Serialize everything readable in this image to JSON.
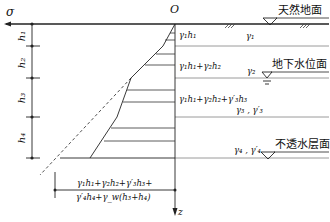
{
  "diagram": {
    "axes": {
      "sigma_label": "σ",
      "origin_label": "O",
      "z_label": "z"
    },
    "layers": [
      {
        "thickness_label": "h₁",
        "unit_weight": "γ₁",
        "stress_label": "γ₁h₁"
      },
      {
        "thickness_label": "h₂",
        "unit_weight": "γ₂",
        "stress_label": "γ₁h₁+γ₂h₂"
      },
      {
        "thickness_label": "h₃",
        "unit_weight": "γ₃ , γ′₃",
        "stress_label": "γ₁h₁+γ₂h₂+γ′₃h₃"
      },
      {
        "thickness_label": "h₄",
        "unit_weight": "γ₄ , γ′₄",
        "stress_label": ""
      }
    ],
    "surfaces": {
      "ground": "天然地面",
      "water_table": "地下水位面",
      "impermeable": "不透水层面"
    },
    "bottom_stress": {
      "line1": "γ₁h₁+γ₂h₂+γ′₃h₃+",
      "line2": "γ′₄h₄+γ_w(h₃+h₄)"
    },
    "colors": {
      "line": "#222222",
      "layer_boundary": "#9a9a9a"
    }
  }
}
